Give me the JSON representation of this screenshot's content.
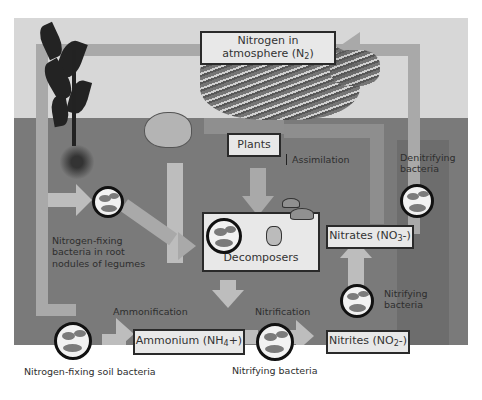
{
  "diagram": {
    "colors": {
      "sky_background": "#d7d7d7",
      "soil_background": "#7a7a7a",
      "arrow_band": "#a9a9a9",
      "box_fill": "#e8e8e8",
      "box_border": "#2a2a2a",
      "bacteria_border": "#111111"
    },
    "nodes": {
      "atmosphere": {
        "label_line1": "Nitrogen in",
        "label_line2": "atmosphere  (N",
        "subscript": "2",
        "label_end": ")"
      },
      "plants": {
        "label": "Plants"
      },
      "decomposers": {
        "label": "Decomposers"
      },
      "nitrates": {
        "label": "Nitrates (NO",
        "subscript": "3",
        "label_end": "-)"
      },
      "nitrites": {
        "label": "Nitrites (NO",
        "subscript": "2",
        "label_end": "-)"
      },
      "ammonium": {
        "label": "Ammonium (NH",
        "subscript": "4",
        "label_end": "+)"
      }
    },
    "labels": {
      "assimilation": "Assimilation",
      "denitrifying_line1": "Denitrifying",
      "denitrifying_line2": "bacteria",
      "root_bacteria_line1": "Nitrogen-fixing",
      "root_bacteria_line2": "bacteria in root",
      "root_bacteria_line3": "nodules of legumes",
      "ammonification": "Ammonification",
      "nitrification": "Nitrification",
      "nitrifying_bottom": "Nitrifying bacteria",
      "nitrifying_right_line1": "Nitrifying",
      "nitrifying_right_line2": "bacteria",
      "soil_bacteria": "Nitrogen-fixing soil bacteria"
    },
    "edges": [
      {
        "from": "atmosphere",
        "to": "root nodule bacteria"
      },
      {
        "from": "atmosphere",
        "to": "soil bacteria"
      },
      {
        "from": "root nodule bacteria",
        "to": "decomposers"
      },
      {
        "from": "plants",
        "to": "decomposers"
      },
      {
        "from": "animals",
        "to": "decomposers"
      },
      {
        "from": "decomposers",
        "to": "ammonium",
        "label": "Ammonification"
      },
      {
        "from": "soil bacteria",
        "to": "ammonium"
      },
      {
        "from": "ammonium",
        "to": "nitrites",
        "label": "Nitrification"
      },
      {
        "from": "nitrites",
        "to": "nitrates"
      },
      {
        "from": "nitrates",
        "to": "plants",
        "label": "Assimilation"
      },
      {
        "from": "nitrates",
        "to": "atmosphere",
        "label": "Denitrifying bacteria"
      }
    ]
  }
}
